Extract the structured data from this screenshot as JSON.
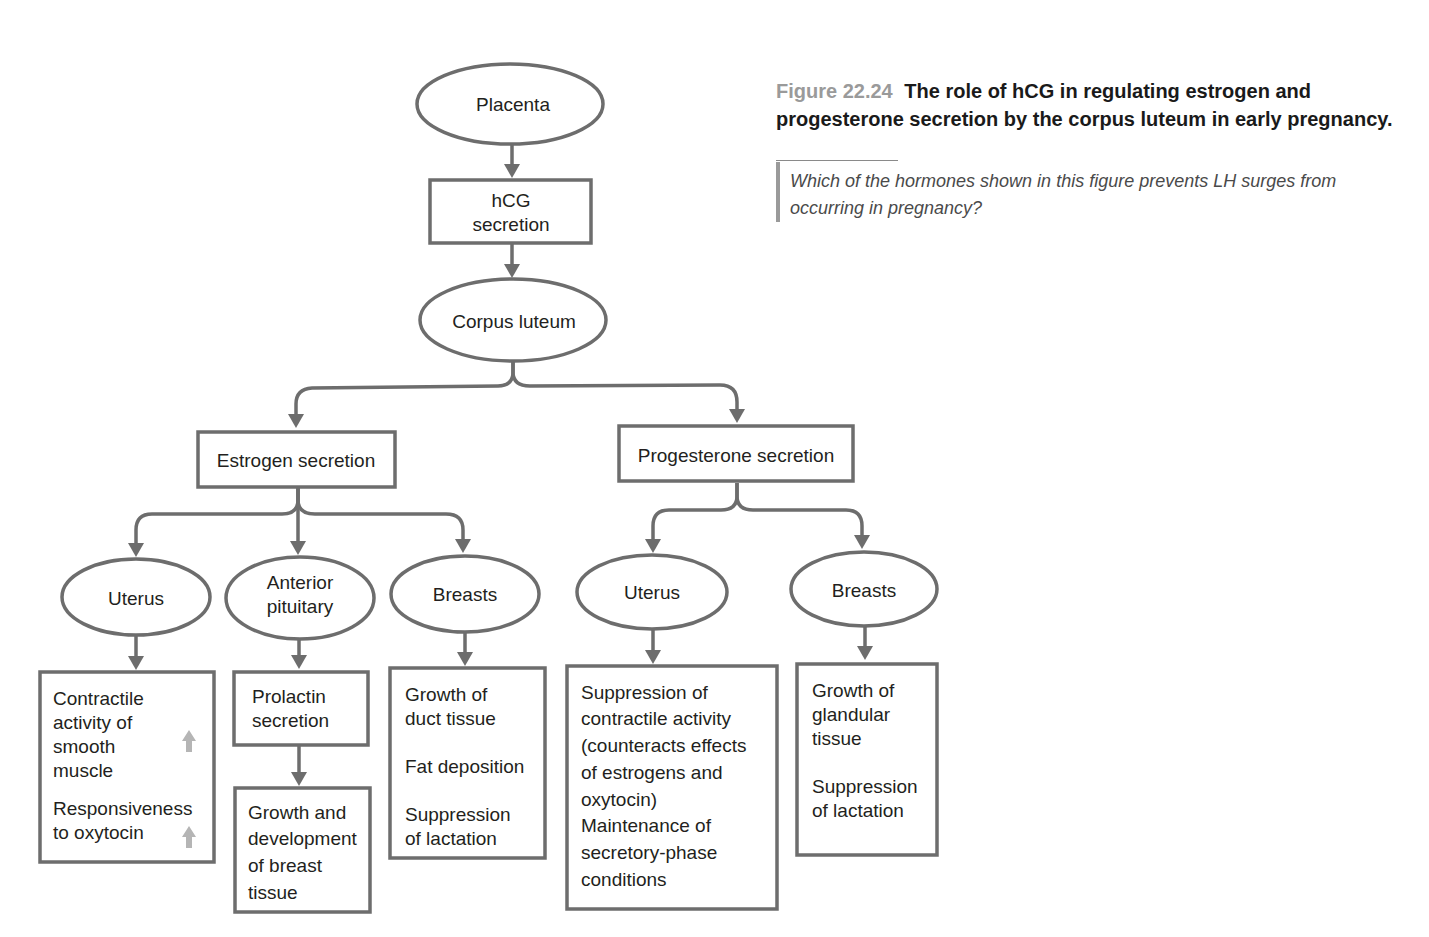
{
  "caption": {
    "figure_number": "Figure 22.24",
    "title": "The role of hCG in regulating estrogen and progesterone secretion by the corpus luteum in early pregnancy."
  },
  "question": {
    "text": "Which of the hormones shown in this figure prevents LH surges from occurring in pregnancy?"
  },
  "colors": {
    "stroke": "#6d6d6d",
    "text": "#231f20",
    "increase_arrow": "#b5b5b5",
    "figure_number": "#9a9a9a"
  },
  "nodes": {
    "placenta": {
      "shape": "ellipse",
      "lines": [
        "Placenta"
      ]
    },
    "hcg": {
      "shape": "box",
      "lines": [
        "hCG",
        "secretion"
      ]
    },
    "corpus_luteum": {
      "shape": "ellipse",
      "lines": [
        "Corpus luteum"
      ]
    },
    "estrogen": {
      "shape": "box",
      "lines": [
        "Estrogen secretion"
      ]
    },
    "progesterone": {
      "shape": "box",
      "lines": [
        "Progesterone secretion"
      ]
    },
    "est_uterus": {
      "shape": "ellipse",
      "lines": [
        "Uterus"
      ]
    },
    "est_pituitary": {
      "shape": "ellipse",
      "lines": [
        "Anterior",
        "pituitary"
      ]
    },
    "est_breasts": {
      "shape": "ellipse",
      "lines": [
        "Breasts"
      ]
    },
    "prog_uterus": {
      "shape": "ellipse",
      "lines": [
        "Uterus"
      ]
    },
    "prog_breasts": {
      "shape": "ellipse",
      "lines": [
        "Breasts"
      ]
    },
    "est_uterus_effects": {
      "shape": "box",
      "lines": [
        "Contractile",
        "activity of",
        "smooth",
        "muscle",
        "Responsiveness",
        "to oxytocin"
      ],
      "increase_markers": [
        "Contractile activity of smooth muscle",
        "Responsiveness to oxytocin"
      ]
    },
    "prolactin": {
      "shape": "box",
      "lines": [
        "Prolactin",
        "secretion"
      ]
    },
    "breast_dev": {
      "shape": "box",
      "lines": [
        "Growth and",
        "development",
        "of breast",
        "tissue"
      ]
    },
    "est_breasts_effects": {
      "shape": "box",
      "lines": [
        "Growth of",
        "duct tissue",
        "Fat deposition",
        "Suppression",
        "of lactation"
      ]
    },
    "prog_uterus_effects": {
      "shape": "box",
      "lines": [
        "Suppression of",
        "contractile activity",
        "(counteracts effects",
        "of estrogens and",
        "oxytocin)",
        "Maintenance of",
        "secretory-phase",
        "conditions"
      ]
    },
    "prog_breasts_effects": {
      "shape": "box",
      "lines": [
        "Growth of",
        "glandular",
        "tissue",
        "Suppression",
        "of lactation"
      ]
    }
  },
  "edges": [
    [
      "Placenta",
      "hCG secretion"
    ],
    [
      "hCG secretion",
      "Corpus luteum"
    ],
    [
      "Corpus luteum",
      "Estrogen secretion"
    ],
    [
      "Corpus luteum",
      "Progesterone secretion"
    ],
    [
      "Estrogen secretion",
      "Uterus"
    ],
    [
      "Estrogen secretion",
      "Anterior pituitary"
    ],
    [
      "Estrogen secretion",
      "Breasts"
    ],
    [
      "Progesterone secretion",
      "Uterus"
    ],
    [
      "Progesterone secretion",
      "Breasts"
    ],
    [
      "Uterus (estrogen)",
      "Contractile activity / Responsiveness to oxytocin"
    ],
    [
      "Anterior pituitary",
      "Prolactin secretion"
    ],
    [
      "Prolactin secretion",
      "Growth and development of breast tissue"
    ],
    [
      "Breasts (estrogen)",
      "Growth of duct tissue / Fat deposition / Suppression of lactation"
    ],
    [
      "Uterus (progesterone)",
      "Suppression of contractile activity / Maintenance of secretory-phase conditions"
    ],
    [
      "Breasts (progesterone)",
      "Growth of glandular tissue / Suppression of lactation"
    ]
  ]
}
